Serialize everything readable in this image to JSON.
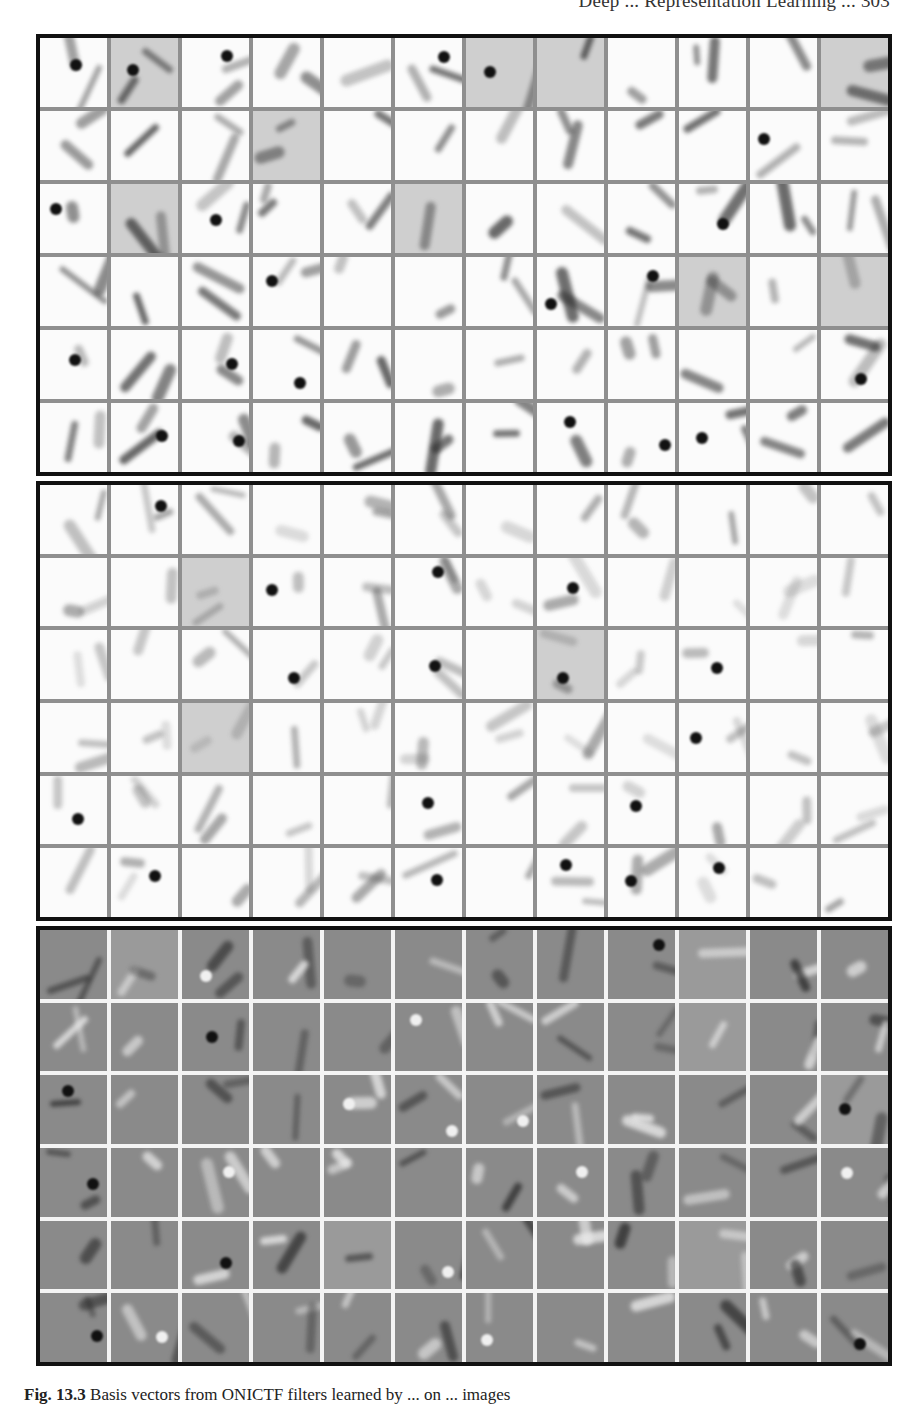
{
  "page": {
    "running_head": "Deep ... Representation Learning ... 303",
    "caption_label": "Fig. 13.3",
    "caption_text": "Basis vectors from ONICTF filters learned by ... on ... images"
  },
  "figure": {
    "panels": [
      {
        "id": "top",
        "style": "white-background filters, dark strokes",
        "rows": 6,
        "cols": 12,
        "grid_color": "#8f8f8f",
        "cell_color": "#fbfbfb"
      },
      {
        "id": "middle",
        "style": "white-background filters, light diffuse strokes",
        "rows": 6,
        "cols": 12,
        "grid_color": "#8f8f8f",
        "cell_color": "#fbfbfb"
      },
      {
        "id": "bottom",
        "style": "gray-background filters, dark and bright strokes",
        "rows": 6,
        "cols": 12,
        "grid_color": "#f4f4f4",
        "cell_color": "#8a8a8a"
      }
    ],
    "border_color": "#111111"
  }
}
